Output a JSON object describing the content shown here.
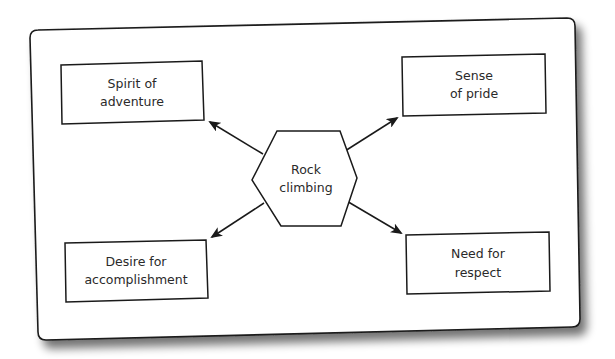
{
  "diagram": {
    "center": {
      "label_line1": "Rock",
      "label_line2": "climbing",
      "shape": "hexagon"
    },
    "nodes": [
      {
        "id": "spirit",
        "line1": "Spirit of",
        "line2": "adventure",
        "position": "top-left"
      },
      {
        "id": "pride",
        "line1": "Sense",
        "line2": "of pride",
        "position": "top-right"
      },
      {
        "id": "accomplishment",
        "line1": "Desire for",
        "line2": "accomplishment",
        "position": "bottom-left"
      },
      {
        "id": "respect",
        "line1": "Need for",
        "line2": "respect",
        "position": "bottom-right"
      }
    ],
    "edges": [
      {
        "from": "center",
        "to": "spirit"
      },
      {
        "from": "center",
        "to": "pride"
      },
      {
        "from": "center",
        "to": "accomplishment"
      },
      {
        "from": "center",
        "to": "respect"
      }
    ],
    "colors": {
      "stroke": "#1a1a1a",
      "panel_fill": "#ffffff",
      "shadow": "#555555"
    }
  }
}
